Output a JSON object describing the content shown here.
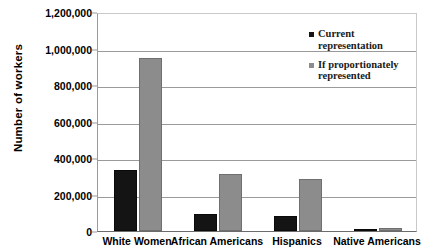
{
  "chart_data": {
    "type": "bar",
    "title": "",
    "xlabel": "",
    "ylabel": "Number of workers",
    "ylim": [
      0,
      1200000
    ],
    "grid": true,
    "legend_position": "top-right",
    "categories": [
      "White Women",
      "African Americans",
      "Hispanics",
      "Native Americans"
    ],
    "ytick_labels": [
      "1,200,000",
      "1,000,000",
      "800,000",
      "600,000",
      "400,000",
      "200,000",
      "0"
    ],
    "ytick_values": [
      1200000,
      1000000,
      800000,
      600000,
      400000,
      200000,
      0
    ],
    "series": [
      {
        "name": "Current representation",
        "color": "#141414",
        "values": [
          335000,
          95000,
          85000,
          9000
        ]
      },
      {
        "name": "If proportionately represented",
        "color": "#8c8c8c",
        "values": [
          950000,
          312000,
          285000,
          17000
        ]
      }
    ]
  },
  "legend": {
    "items": [
      {
        "label_line1": "Current",
        "label_line2": "representation",
        "swatch": "black-square-icon"
      },
      {
        "label_line1": "If proportionately",
        "label_line2": "represented",
        "swatch": "gray-square-icon"
      }
    ]
  },
  "colors": {
    "current": "#141414",
    "proportional": "#8c8c8c",
    "gridline": "#9a9a9a",
    "axis": "#6b6b6b",
    "background": "#ffffff"
  }
}
